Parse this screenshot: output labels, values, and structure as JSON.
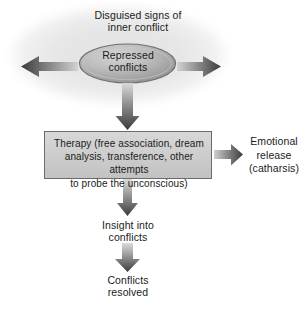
{
  "diagram": {
    "cloud": {
      "caption": "Disguised signs of\ninner conflict",
      "fill_color": "#e9e9e9"
    },
    "core": {
      "caption": "Repressed\nconflicts",
      "fill_color": "#b4b4b4",
      "edge_color": "#6e6e6e"
    },
    "therapy_box": {
      "text": "Therapy (free association, dream\nanalysis, transference, other attempts\nto probe the unconscious)",
      "fill_color": "#cfcfcf",
      "border_color": "#6b6b6b"
    },
    "catharsis": {
      "text": "Emotional\nrelease\n(catharsis)"
    },
    "insight": {
      "text": "Insight into\nconflicts"
    },
    "resolved": {
      "text": "Conflicts\nresolved"
    },
    "arrows": [
      {
        "name": "arrow-left-disguised-signs",
        "direction": "left"
      },
      {
        "name": "arrow-right-disguised-signs",
        "direction": "right"
      },
      {
        "name": "arrow-core-to-therapy",
        "direction": "down"
      },
      {
        "name": "arrow-therapy-to-catharsis",
        "direction": "right"
      },
      {
        "name": "arrow-therapy-to-insight",
        "direction": "down"
      },
      {
        "name": "arrow-insight-to-resolved",
        "direction": "down"
      }
    ],
    "arrow_color_dark": "#3b3b3b",
    "arrow_color_light": "#d8d8d8",
    "text_color": "#1b1b1b",
    "background_color": "#ffffff"
  }
}
